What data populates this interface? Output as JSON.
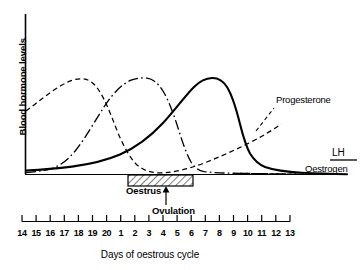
{
  "chart_data": {
    "type": "line",
    "title": "",
    "xlabel": "Days of oestrous cycle",
    "ylabel": "Blood hormone levels",
    "grid": false,
    "legend_position": "inline-right",
    "x_tick_labels": [
      "14",
      "15",
      "16",
      "17",
      "18",
      "19",
      "20",
      "1",
      "2",
      "3",
      "4",
      "5",
      "6",
      "7",
      "8",
      "9",
      "10",
      "11",
      "12",
      "13"
    ],
    "xlim": [
      0,
      19
    ],
    "ylim": [
      0,
      1
    ],
    "y_axis_ticks": [],
    "annotations": [
      {
        "name": "oestrus",
        "label": "Oestrus",
        "type": "hatched-box",
        "x_start_day": "1",
        "x_end_day": "6"
      },
      {
        "name": "ovulation",
        "label": "Ovulation",
        "type": "arrow",
        "x_day": "5"
      }
    ],
    "series": [
      {
        "name": "Progesterone",
        "style": "dashed",
        "label": "Progesterone",
        "x": [
          0,
          1,
          2,
          3,
          4,
          5,
          6,
          7,
          8,
          9,
          10,
          11,
          12,
          13,
          14,
          15,
          16,
          17,
          18,
          19
        ],
        "y": [
          0.63,
          0.76,
          0.88,
          0.95,
          0.98,
          0.93,
          0.77,
          0.55,
          0.33,
          0.16,
          0.09,
          0.08,
          0.09,
          0.12,
          0.18,
          0.27,
          0.38,
          0.5,
          0.62,
          0.74
        ]
      },
      {
        "name": "Oestrogen",
        "style": "dash-dot",
        "label": "Oestrogen",
        "x": [
          0,
          1,
          2,
          3,
          4,
          5,
          6,
          7,
          8,
          9,
          10,
          11,
          12,
          13,
          14,
          15,
          16,
          17,
          18,
          19
        ],
        "y": [
          0.02,
          0.03,
          0.05,
          0.1,
          0.21,
          0.42,
          0.68,
          0.89,
          0.99,
          0.92,
          0.66,
          0.33,
          0.14,
          0.09,
          0.08,
          0.07,
          0.06,
          0.05,
          0.04,
          0.03
        ]
      },
      {
        "name": "LH",
        "style": "solid",
        "label": "LH",
        "x": [
          0,
          1,
          2,
          3,
          4,
          5,
          6,
          7,
          8,
          9,
          10,
          11,
          12,
          13,
          14,
          15,
          16,
          17,
          18,
          19
        ],
        "y": [
          0.04,
          0.05,
          0.06,
          0.08,
          0.11,
          0.16,
          0.23,
          0.34,
          0.5,
          0.72,
          0.92,
          1.0,
          0.98,
          0.8,
          0.4,
          0.2,
          0.13,
          0.1,
          0.09,
          0.08
        ]
      }
    ]
  },
  "axis": {
    "y_label": "Blood hormone levels",
    "x_label": "Days of oestrous cycle"
  },
  "labels": {
    "progesterone": "Progesterone",
    "lh": "LH",
    "oestrogen": "Oestrogen",
    "oestrus": "Oestrus",
    "ovulation": "Ovulation"
  },
  "ticks": [
    "14",
    "15",
    "16",
    "17",
    "18",
    "19",
    "20",
    "1",
    "2",
    "3",
    "4",
    "5",
    "6",
    "7",
    "8",
    "9",
    "10",
    "11",
    "12",
    "13"
  ],
  "colors": {
    "ink": "#000000",
    "background": "#ffffff"
  }
}
